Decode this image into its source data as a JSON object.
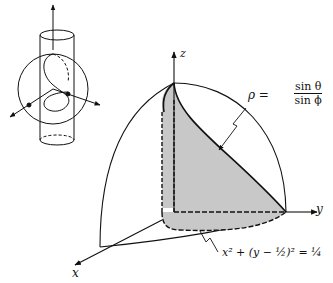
{
  "figure": {
    "axes": {
      "x_label": "x",
      "y_label": "y",
      "z_label": "z"
    },
    "annotations": {
      "surface_lhs": "ρ =",
      "surface_num": "sin θ",
      "surface_den": "sin ϕ",
      "cylinder_equation": "x² + (y − ½)² = ¼"
    },
    "colors": {
      "ink": "#111111",
      "shade": "#c8c8c8",
      "background": "#ffffff"
    },
    "inset": {
      "description": "sphere intersected by vertical cylinder with axes"
    }
  }
}
